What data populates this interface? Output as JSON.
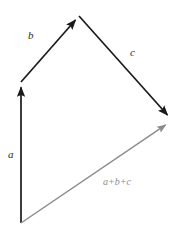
{
  "figure": {
    "background_color": "#ffffff",
    "width": 189,
    "height": 237
  },
  "colors": {
    "vector_black": "#1a1a1a",
    "vector_gray": "#8c8c8c",
    "label_black": "#2b2b2b",
    "label_gray": "#8c8c8c",
    "background": "#ffffff"
  },
  "labels": {
    "a": "a",
    "b": "b",
    "c": "c",
    "sum": "a+b+c"
  },
  "chart_data": {
    "type": "diagram",
    "xlabel": "",
    "ylabel": "",
    "grid": false,
    "legend": "none",
    "xlim": [
      0,
      189
    ],
    "ylim": [
      237,
      0
    ],
    "vectors": [
      {
        "name": "a",
        "label": "a",
        "color": "#1a1a1a",
        "start": [
          21,
          223
        ],
        "end": [
          21,
          82
        ],
        "components": [
          0,
          -141
        ],
        "label_pos": [
          11,
          155
        ],
        "arrowhead": true
      },
      {
        "name": "b",
        "label": "b",
        "color": "#1a1a1a",
        "start": [
          21,
          82
        ],
        "end": [
          79,
          16
        ],
        "components": [
          58,
          -66
        ],
        "label_pos": [
          31,
          36
        ],
        "arrowhead": true
      },
      {
        "name": "c",
        "label": "c",
        "color": "#1a1a1a",
        "start": [
          79,
          16
        ],
        "end": [
          171,
          119
        ],
        "components": [
          92,
          103
        ],
        "label_pos": [
          133,
          53
        ],
        "arrowhead": true
      },
      {
        "name": "resultant",
        "label": "a+b+c",
        "color": "#8c8c8c",
        "start": [
          21,
          223
        ],
        "end": [
          170,
          122
        ],
        "components": [
          149,
          -101
        ],
        "label_pos": [
          122,
          183
        ],
        "arrowhead": true
      }
    ]
  }
}
